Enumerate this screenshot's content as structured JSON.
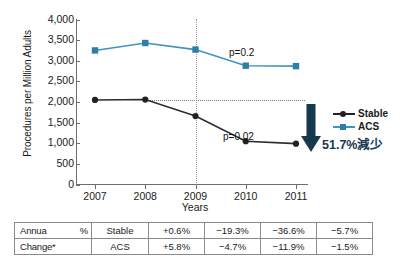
{
  "chart_data": {
    "type": "line",
    "title": "",
    "xlabel": "Years",
    "ylabel": "Procedures per Million Adults",
    "categories": [
      "2007",
      "2008",
      "2009",
      "2010",
      "2011"
    ],
    "ylim": [
      0,
      4000
    ],
    "ytick_values": [
      0,
      500,
      1000,
      1500,
      2000,
      2500,
      3000,
      3500,
      4000
    ],
    "ytick_labels": [
      "0",
      "500",
      "1,000",
      "1,500",
      "2,000",
      "2,500",
      "3,000",
      "3,500",
      "4,000"
    ],
    "grid": false,
    "legend_position": "right",
    "series": [
      {
        "name": "Stable",
        "color": "#222222",
        "marker": "circle",
        "values": [
          2050,
          2060,
          1660,
          1050,
          990
        ],
        "annotation": "p=0.02"
      },
      {
        "name": "ACS",
        "color": "#2d7fa8",
        "marker": "square",
        "values": [
          3250,
          3430,
          3270,
          2880,
          2870
        ],
        "annotation": "p=0.2"
      }
    ],
    "reference_lines": [
      {
        "orientation": "vertical",
        "value": "2009",
        "style": "dotted"
      },
      {
        "orientation": "horizontal",
        "value": 2050,
        "style": "dotted"
      }
    ],
    "annotations": [
      {
        "text": "p=0.2",
        "series": "ACS"
      },
      {
        "text": "p=0.02",
        "series": "Stable"
      },
      {
        "text": "51.7%減少",
        "color": "#17394f"
      }
    ]
  },
  "legend": {
    "items": [
      {
        "label": "Stable",
        "color": "#222222",
        "marker": "circle"
      },
      {
        "label": "ACS",
        "color": "#2d7fa8",
        "marker": "square"
      }
    ]
  },
  "callout": {
    "arrow": "down-arrow",
    "text": "51.7%減少",
    "color": "#17394f"
  },
  "table": {
    "row_label_line1_left": "Annua",
    "row_label_line1_right": "%",
    "row_label_line2": "Change*",
    "rows": [
      {
        "series": "Stable",
        "values": [
          "+0.6%",
          "−19.3%",
          "−36.6%",
          "−5.7%"
        ]
      },
      {
        "series": "ACS",
        "values": [
          "+5.8%",
          "−4.7%",
          "−11.9%",
          "−1.5%"
        ]
      }
    ]
  }
}
